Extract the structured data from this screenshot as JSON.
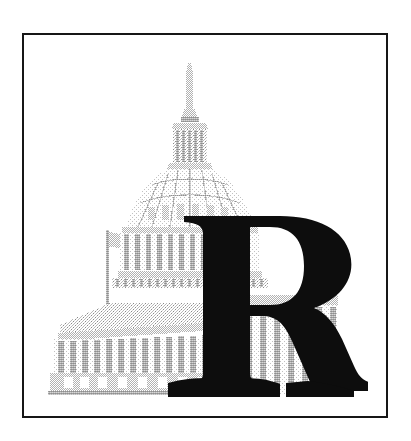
{
  "image": {
    "kind": "logo-emblem",
    "subject": "United States Capitol building with monogram letter",
    "background_color": "#ffffff",
    "alt_text": "U.S. Capitol dome behind a large bold serif letter R"
  },
  "frame": {
    "name": "rectangular-border",
    "stroke_color": "#161616",
    "stroke_width_px": 2.5,
    "x": 22,
    "y": 33,
    "width": 366,
    "height": 385
  },
  "capitol": {
    "label": "US Capitol building",
    "render_style": "halftone-dither engraving",
    "ink_light": "#d6d6d6",
    "ink_mid": "#b3b3b3",
    "ink_dark": "#8f8f8f",
    "features": [
      "statue-of-freedom-spire",
      "lantern-cupola",
      "ribbed-dome",
      "peristyle-colonnade",
      "drum-colonnade",
      "east-front-portico",
      "flagpole-with-flag",
      "basement-windows"
    ]
  },
  "monogram": {
    "letter": "R",
    "style": "bold serif capital",
    "fill_color": "#0d0d0d",
    "x": 156,
    "y": 211,
    "width": 210,
    "height": 192
  }
}
